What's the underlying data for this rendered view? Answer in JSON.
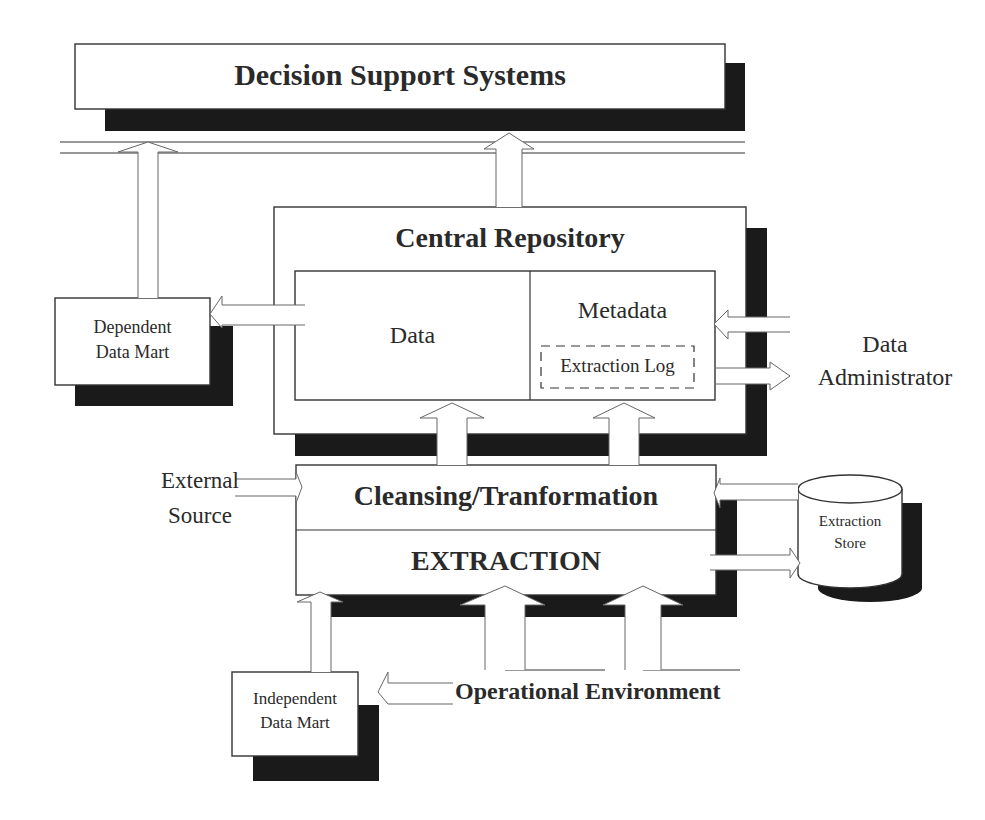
{
  "diagram": {
    "title_nodes": {
      "dss": "Decision Support Systems",
      "central_repository": "Central Repository",
      "data": "Data",
      "metadata": "Metadata",
      "extraction_log": "Extraction Log",
      "cleansing": "Cleansing/Tranformation",
      "extraction": "EXTRACTION",
      "operational_environment": "Operational Environment"
    },
    "dependent_data_mart": {
      "line1": "Dependent",
      "line2": "Data Mart"
    },
    "independent_data_mart": {
      "line1": "Independent",
      "line2": "Data Mart"
    },
    "data_administrator": {
      "line1": "Data",
      "line2": "Administrator"
    },
    "external_source": {
      "line1": "External",
      "line2": "Source"
    },
    "extraction_store": {
      "line1": "Extraction",
      "line2": "Store"
    },
    "colors": {
      "stroke": "#333333",
      "shadow": "#1a1a1a",
      "fill": "#ffffff"
    }
  }
}
